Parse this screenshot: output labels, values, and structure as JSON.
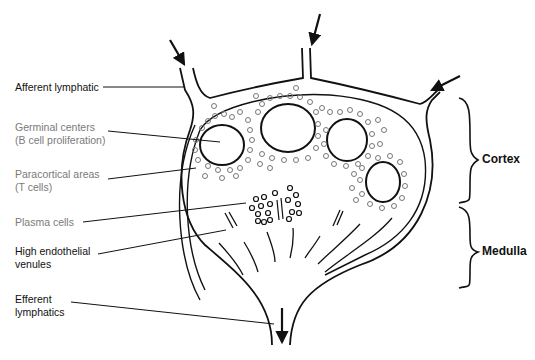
{
  "labels": {
    "afferent": "Afferent lymphatic",
    "germinal_1": "Germinal centers",
    "germinal_2": "(B cell proliferation)",
    "paracortical_1": "Paracortical areas",
    "paracortical_2": "(T cells)",
    "plasma": "Plasma cells",
    "hev_1": "High endothelial",
    "hev_2": "venules",
    "efferent_1": "Efferent",
    "efferent_2": "lymphatics"
  },
  "regions": {
    "cortex": "Cortex",
    "medulla": "Medulla"
  },
  "colors": {
    "line": "#111111",
    "cell": "#777777",
    "gray_text": "#7a7a7a"
  }
}
